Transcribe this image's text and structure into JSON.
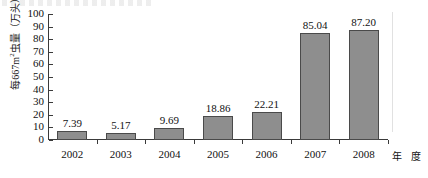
{
  "chart_data": {
    "type": "bar",
    "title": "",
    "xlabel": "年 度",
    "ylabel": "每667m2虫量(万头)",
    "ylabel_prefix": "每667m",
    "ylabel_superscript": "2",
    "ylabel_suffix": "虫量（万头）",
    "categories": [
      "2002",
      "2003",
      "2004",
      "2005",
      "2006",
      "2007",
      "2008"
    ],
    "values": [
      7.39,
      5.17,
      9.69,
      18.86,
      22.21,
      85.04,
      87.2
    ],
    "value_labels": [
      "7.39",
      "5.17",
      "9.69",
      "18.86",
      "22.21",
      "85.04",
      "87.20"
    ],
    "ylim": [
      0,
      100
    ],
    "ytick_labels": [
      "100",
      "90",
      "80",
      "70",
      "60",
      "50",
      "40",
      "30",
      "20",
      "10",
      "0"
    ],
    "ytick_values": [
      100,
      90,
      80,
      70,
      60,
      50,
      40,
      30,
      20,
      10,
      0
    ],
    "grid": false,
    "legend": null,
    "bar_color": "#8e8e8e",
    "bar_border_color": "#4a4a4a",
    "axis_color": "#3a3a3a",
    "background_color": "#ffffff"
  }
}
